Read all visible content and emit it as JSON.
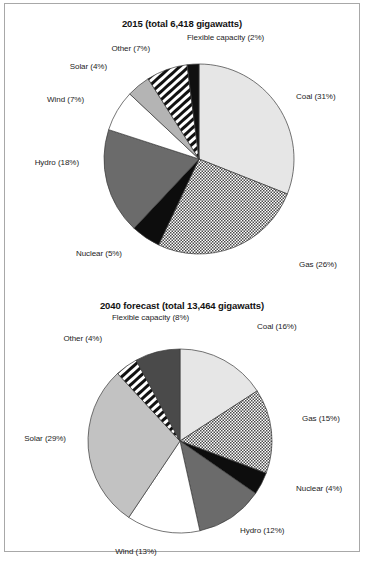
{
  "figure": {
    "background": "#ffffff",
    "frame_color": "#a8a8a8"
  },
  "chart_data": [
    {
      "type": "pie",
      "title": "2015 (total 6,418 gigawatts)",
      "total_label": "6,418 gigawatts",
      "year": "2015",
      "unit": "gigawatts",
      "categories": [
        "Coal",
        "Gas",
        "Nuclear",
        "Hydro",
        "Wind",
        "Solar",
        "Other",
        "Flexible capacity"
      ],
      "values": [
        31,
        26,
        5,
        18,
        7,
        4,
        7,
        2
      ],
      "labels": [
        "Coal (31%)",
        "Gas (26%)",
        "Nuclear (5%)",
        "Hydro (18%)",
        "Wind (7%)",
        "Solar (4%)",
        "Other (7%)",
        "Flexible capacity (2%)"
      ],
      "fills": [
        "light-gray",
        "dot-hatch",
        "black",
        "mid-dark-gray",
        "white",
        "light-mid-gray",
        "diagonal-stripe",
        "black"
      ],
      "colors": [
        "#e6e6e6",
        "#9a9a9a",
        "#0d0d0d",
        "#6b6b6b",
        "#ffffff",
        "#b4b4b4",
        "#141414",
        "#101010"
      ],
      "start_angle_deg": 0,
      "direction": "clockwise",
      "legend": "none",
      "grid": false
    },
    {
      "type": "pie",
      "title": "2040 forecast (total 13,464 gigawatts)",
      "total_label": "13,464 gigawatts",
      "year": "2040 forecast",
      "unit": "gigawatts",
      "categories": [
        "Coal",
        "Gas",
        "Nuclear",
        "Hydro",
        "Wind",
        "Solar",
        "Other",
        "Flexible capacity"
      ],
      "values": [
        16,
        15,
        4,
        12,
        13,
        29,
        4,
        8
      ],
      "labels": [
        "Coal (16%)",
        "Gas (15%)",
        "Nuclear (4%)",
        "Hydro (12%)",
        "Wind (13%)",
        "Solar (29%)",
        "Other (4%)",
        "Flexible capacity (8%)"
      ],
      "fills": [
        "light-gray",
        "dot-hatch",
        "black",
        "mid-dark-gray",
        "white",
        "light-mid-gray",
        "diagonal-stripe",
        "dark-gray"
      ],
      "colors": [
        "#e6e6e6",
        "#9a9a9a",
        "#0d0d0d",
        "#6b6b6b",
        "#ffffff",
        "#c2c2c2",
        "#141414",
        "#4a4a4a"
      ],
      "start_angle_deg": 0,
      "direction": "clockwise",
      "legend": "none",
      "grid": false
    }
  ]
}
